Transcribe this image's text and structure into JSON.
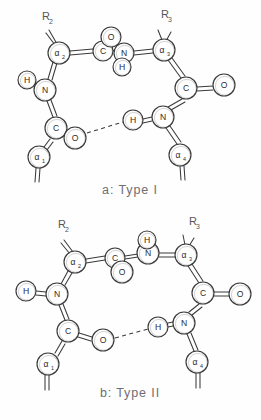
{
  "figure": {
    "title_a": "a: Type I",
    "title_b": "b: Type II",
    "stroke_color": "#3a3a3a",
    "circle_fill": "#ffffff",
    "caption_color": "#6e6e73",
    "background": "#fefefe",
    "bottom_artifact": ""
  },
  "diagram_a": {
    "caption": "a: Type I",
    "atoms": [
      {
        "id": "a-alpha2",
        "label": "α",
        "sub": "2",
        "cx": 59,
        "cy": 53,
        "r": 11
      },
      {
        "id": "a-c-top",
        "label": "C",
        "sub": "",
        "cx": 103,
        "cy": 51,
        "r": 10
      },
      {
        "id": "a-o-top",
        "label": "O",
        "sub": "",
        "cx": 111,
        "cy": 37,
        "r": 10
      },
      {
        "id": "a-n-top",
        "label": "N",
        "sub": "",
        "cx": 124,
        "cy": 53,
        "r": 10
      },
      {
        "id": "a-h-top",
        "label": "H",
        "sub": "",
        "cx": 122,
        "cy": 67,
        "r": 9
      },
      {
        "id": "a-alpha3",
        "label": "α",
        "sub": "3",
        "cx": 164,
        "cy": 50,
        "r": 11
      },
      {
        "id": "a-c-right",
        "label": "C",
        "sub": "",
        "cx": 186,
        "cy": 88,
        "r": 11
      },
      {
        "id": "a-o-right",
        "label": "O",
        "sub": "",
        "cx": 224,
        "cy": 85,
        "r": 11
      },
      {
        "id": "a-n-left",
        "label": "N",
        "sub": "",
        "cx": 45,
        "cy": 90,
        "r": 11
      },
      {
        "id": "a-h-left",
        "label": "H",
        "sub": "",
        "cx": 27,
        "cy": 80,
        "r": 9
      },
      {
        "id": "a-c-left",
        "label": "C",
        "sub": "",
        "cx": 56,
        "cy": 128,
        "r": 11
      },
      {
        "id": "a-o-left",
        "label": "O",
        "sub": "",
        "cx": 75,
        "cy": 138,
        "r": 11
      },
      {
        "id": "a-h-bond",
        "label": "H",
        "sub": "",
        "cx": 133,
        "cy": 120,
        "r": 10
      },
      {
        "id": "a-n-right",
        "label": "N",
        "sub": "",
        "cx": 163,
        "cy": 117,
        "r": 11
      },
      {
        "id": "a-alpha1",
        "label": "α",
        "sub": "1",
        "cx": 39,
        "cy": 157,
        "r": 11
      },
      {
        "id": "a-alpha4",
        "label": "α",
        "sub": "4",
        "cx": 180,
        "cy": 155,
        "r": 11
      }
    ],
    "side_labels": [
      {
        "id": "a-r2",
        "text": "R",
        "sub": "2",
        "x": 42,
        "y": 20
      },
      {
        "id": "a-r3",
        "text": "R",
        "sub": "3",
        "x": 161,
        "y": 18
      }
    ],
    "hydrogen_bond": {
      "from": "a-o-left",
      "to": "a-h-bond",
      "style": "dashed"
    }
  },
  "diagram_b": {
    "caption": "b: Type II",
    "atoms": [
      {
        "id": "b-alpha2",
        "label": "α",
        "sub": "2",
        "cx": 75,
        "cy": 262,
        "r": 11
      },
      {
        "id": "b-c-top",
        "label": "C",
        "sub": "",
        "cx": 115,
        "cy": 258,
        "r": 10
      },
      {
        "id": "b-o-top",
        "label": "O",
        "sub": "",
        "cx": 122,
        "cy": 272,
        "r": 11
      },
      {
        "id": "b-n-top",
        "label": "N",
        "sub": "",
        "cx": 148,
        "cy": 253,
        "r": 11
      },
      {
        "id": "b-h-top",
        "label": "H",
        "sub": "",
        "cx": 147,
        "cy": 240,
        "r": 9
      },
      {
        "id": "b-alpha3",
        "label": "α",
        "sub": "3",
        "cx": 186,
        "cy": 255,
        "r": 11
      },
      {
        "id": "b-c-right",
        "label": "C",
        "sub": "",
        "cx": 203,
        "cy": 293,
        "r": 11
      },
      {
        "id": "b-o-right",
        "label": "O",
        "sub": "",
        "cx": 240,
        "cy": 294,
        "r": 11
      },
      {
        "id": "b-n-left",
        "label": "N",
        "sub": "",
        "cx": 57,
        "cy": 294,
        "r": 11
      },
      {
        "id": "b-h-left",
        "label": "H",
        "sub": "",
        "cx": 26,
        "cy": 291,
        "r": 10
      },
      {
        "id": "b-c-left",
        "label": "C",
        "sub": "",
        "cx": 68,
        "cy": 331,
        "r": 11
      },
      {
        "id": "b-o-left",
        "label": "O",
        "sub": "",
        "cx": 103,
        "cy": 340,
        "r": 11
      },
      {
        "id": "b-h-bond",
        "label": "H",
        "sub": "",
        "cx": 158,
        "cy": 327,
        "r": 10
      },
      {
        "id": "b-n-right",
        "label": "N",
        "sub": "",
        "cx": 184,
        "cy": 323,
        "r": 11
      },
      {
        "id": "b-alpha1",
        "label": "α",
        "sub": "1",
        "cx": 48,
        "cy": 364,
        "r": 11
      },
      {
        "id": "b-alpha4",
        "label": "α",
        "sub": "4",
        "cx": 197,
        "cy": 362,
        "r": 11
      }
    ],
    "side_labels": [
      {
        "id": "b-r2",
        "text": "R",
        "sub": "2",
        "x": 58,
        "y": 228
      },
      {
        "id": "b-r3",
        "text": "R",
        "sub": "3",
        "x": 189,
        "y": 225
      }
    ],
    "hydrogen_bond": {
      "from": "b-o-left",
      "to": "b-h-bond",
      "style": "dashed"
    }
  }
}
